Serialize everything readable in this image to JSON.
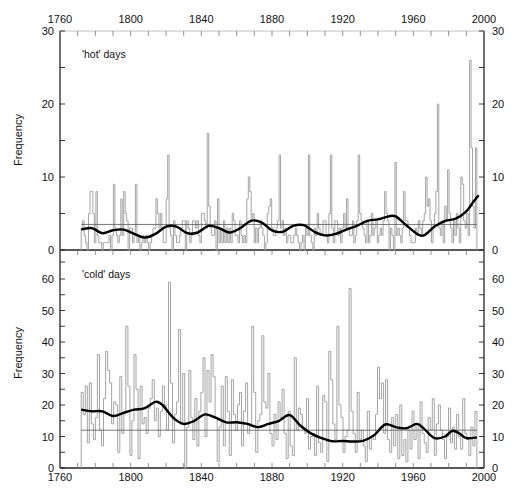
{
  "chart_data": [
    {
      "type": "line",
      "panel": "top",
      "title": "'hot' days",
      "xlabel": "",
      "ylabel": "Frequency",
      "xlim": [
        1760,
        2000
      ],
      "ylim": [
        0,
        30
      ],
      "x_ticks": [
        1760,
        1800,
        1840,
        1880,
        1920,
        1960,
        2000
      ],
      "y_ticks": [
        0,
        10,
        20,
        30
      ],
      "grid": false,
      "mean_line": 3.5,
      "series": [
        {
          "name": "annual frequency",
          "style": "step",
          "color": "#9a9a9a",
          "x_start": 1772,
          "values": [
            3,
            4,
            2,
            1,
            0,
            5,
            8,
            8,
            5,
            1,
            8,
            2,
            1,
            1,
            0,
            1,
            1,
            1,
            1,
            2,
            0,
            2,
            9,
            3,
            2,
            1,
            2,
            7,
            2,
            8,
            5,
            4,
            0,
            3,
            3,
            1,
            2,
            9,
            1,
            2,
            0,
            1,
            2,
            1,
            2,
            1,
            0,
            1,
            2,
            3,
            3,
            7,
            5,
            3,
            5,
            3,
            1,
            1,
            7,
            13,
            3,
            2,
            0,
            4,
            2,
            1,
            1,
            2,
            3,
            4,
            4,
            0,
            4,
            3,
            1,
            2,
            4,
            4,
            3,
            4,
            2,
            1,
            5,
            5,
            4,
            3,
            16,
            6,
            3,
            2,
            2,
            4,
            0,
            7,
            1,
            3,
            1,
            4,
            1,
            3,
            1,
            3,
            1,
            5,
            4,
            2,
            2,
            1,
            4,
            2,
            1,
            2,
            1,
            7,
            10,
            8,
            4,
            5,
            1,
            3,
            1,
            3,
            4,
            3,
            2,
            0,
            1,
            5,
            6,
            7,
            3,
            2,
            2,
            3,
            4,
            13,
            3,
            4,
            2,
            3,
            1,
            2,
            2,
            1,
            1,
            2,
            3,
            2,
            1,
            0,
            1,
            2,
            0,
            3,
            2,
            13,
            2,
            1,
            0,
            3,
            2,
            5,
            3,
            2,
            2,
            4,
            4,
            2,
            1,
            5,
            13,
            3,
            1,
            4,
            4,
            2,
            3,
            1,
            3,
            5,
            3,
            7,
            3,
            2,
            2,
            4,
            1,
            2,
            4,
            13,
            5,
            4,
            3,
            2,
            1,
            4,
            1,
            2,
            5,
            2,
            3,
            4,
            1,
            2,
            3,
            2,
            4,
            8,
            5,
            4,
            0,
            3,
            2,
            0,
            12,
            2,
            3,
            2,
            1,
            3,
            8,
            4,
            4,
            3,
            2,
            1,
            1,
            1,
            3,
            2,
            4,
            3,
            2,
            4,
            5,
            10,
            6,
            7,
            4,
            1,
            3,
            5,
            8,
            20,
            3,
            2,
            4,
            1,
            6,
            4,
            11,
            5,
            3,
            1,
            4,
            2,
            5,
            3,
            1,
            10,
            9,
            4,
            3,
            5,
            2,
            26,
            14,
            6,
            3,
            14
          ]
        },
        {
          "name": "smoothed",
          "style": "smooth",
          "color": "#000000",
          "points": [
            [
              1772,
              2.8
            ],
            [
              1778,
              3.0
            ],
            [
              1784,
              2.3
            ],
            [
              1790,
              2.7
            ],
            [
              1796,
              2.8
            ],
            [
              1802,
              2.2
            ],
            [
              1808,
              1.7
            ],
            [
              1814,
              2.2
            ],
            [
              1820,
              3.2
            ],
            [
              1826,
              3.2
            ],
            [
              1832,
              2.3
            ],
            [
              1838,
              2.4
            ],
            [
              1844,
              3.3
            ],
            [
              1850,
              3.0
            ],
            [
              1856,
              2.4
            ],
            [
              1862,
              3.0
            ],
            [
              1868,
              4.0
            ],
            [
              1874,
              3.8
            ],
            [
              1880,
              2.7
            ],
            [
              1886,
              2.5
            ],
            [
              1892,
              3.3
            ],
            [
              1898,
              3.4
            ],
            [
              1904,
              2.5
            ],
            [
              1910,
              2.0
            ],
            [
              1916,
              2.2
            ],
            [
              1922,
              2.8
            ],
            [
              1928,
              3.3
            ],
            [
              1934,
              4.0
            ],
            [
              1940,
              4.2
            ],
            [
              1946,
              4.6
            ],
            [
              1950,
              4.6
            ],
            [
              1956,
              3.4
            ],
            [
              1962,
              2.2
            ],
            [
              1966,
              2.0
            ],
            [
              1972,
              3.2
            ],
            [
              1978,
              4.0
            ],
            [
              1984,
              4.3
            ],
            [
              1990,
              5.3
            ],
            [
              1994,
              6.6
            ],
            [
              1997,
              7.5
            ]
          ]
        }
      ]
    },
    {
      "type": "line",
      "panel": "bottom",
      "title": "'cold' days",
      "xlabel": "",
      "ylabel": "Frequency",
      "xlim": [
        1760,
        2000
      ],
      "ylim": [
        0,
        65
      ],
      "x_ticks": [
        1760,
        1800,
        1840,
        1880,
        1920,
        1960,
        2000
      ],
      "y_ticks": [
        0,
        10,
        20,
        30,
        40,
        50,
        60
      ],
      "grid": false,
      "mean_line": 12,
      "series": [
        {
          "name": "annual frequency",
          "style": "step",
          "color": "#9a9a9a",
          "x_start": 1772,
          "values": [
            24,
            17,
            26,
            8,
            27,
            14,
            9,
            16,
            36,
            12,
            7,
            22,
            37,
            31,
            27,
            14,
            21,
            20,
            5,
            29,
            11,
            18,
            45,
            26,
            4,
            15,
            36,
            25,
            3,
            26,
            14,
            16,
            11,
            19,
            22,
            28,
            15,
            19,
            10,
            18,
            26,
            20,
            12,
            59,
            27,
            8,
            17,
            21,
            44,
            14,
            30,
            0,
            13,
            31,
            16,
            9,
            22,
            7,
            18,
            24,
            35,
            10,
            31,
            21,
            36,
            29,
            16,
            2,
            13,
            26,
            7,
            29,
            18,
            4,
            28,
            17,
            12,
            20,
            24,
            7,
            18,
            27,
            11,
            14,
            45,
            24,
            5,
            15,
            17,
            42,
            21,
            19,
            30,
            11,
            7,
            17,
            9,
            21,
            16,
            25,
            11,
            3,
            18,
            7,
            4,
            35,
            12,
            19,
            17,
            13,
            11,
            22,
            6,
            10,
            11,
            4,
            26,
            8,
            5,
            23,
            21,
            2,
            37,
            28,
            14,
            9,
            45,
            20,
            16,
            5,
            10,
            12,
            57,
            18,
            11,
            5,
            24,
            9,
            12,
            7,
            2,
            18,
            6,
            10,
            9,
            17,
            32,
            22,
            27,
            11,
            28,
            9,
            5,
            16,
            7,
            17,
            3,
            20,
            4,
            9,
            2,
            12,
            6,
            18,
            9,
            14,
            3,
            21,
            11,
            8,
            5,
            16,
            12,
            22,
            4,
            14,
            20,
            12,
            9,
            3,
            10,
            19,
            8,
            13,
            6,
            17,
            10,
            6,
            22,
            11,
            9,
            4,
            13,
            7,
            18
          ]
        },
        {
          "name": "smoothed",
          "style": "smooth",
          "color": "#000000",
          "points": [
            [
              1772,
              18.5
            ],
            [
              1778,
              18.0
            ],
            [
              1784,
              18.0
            ],
            [
              1790,
              16.5
            ],
            [
              1796,
              17.5
            ],
            [
              1802,
              18.5
            ],
            [
              1808,
              19.0
            ],
            [
              1814,
              21.0
            ],
            [
              1818,
              20.0
            ],
            [
              1824,
              16.0
            ],
            [
              1830,
              14.0
            ],
            [
              1836,
              15.0
            ],
            [
              1842,
              17.0
            ],
            [
              1848,
              16.0
            ],
            [
              1854,
              14.5
            ],
            [
              1860,
              14.5
            ],
            [
              1866,
              14.0
            ],
            [
              1872,
              13.0
            ],
            [
              1878,
              14.0
            ],
            [
              1884,
              15.0
            ],
            [
              1890,
              16.8
            ],
            [
              1896,
              13.5
            ],
            [
              1902,
              11.0
            ],
            [
              1908,
              9.5
            ],
            [
              1914,
              8.5
            ],
            [
              1920,
              8.6
            ],
            [
              1926,
              8.4
            ],
            [
              1932,
              8.7
            ],
            [
              1938,
              10.5
            ],
            [
              1944,
              13.8
            ],
            [
              1950,
              13.0
            ],
            [
              1956,
              12.6
            ],
            [
              1962,
              14.0
            ],
            [
              1966,
              12.5
            ],
            [
              1972,
              9.5
            ],
            [
              1978,
              10.0
            ],
            [
              1982,
              11.8
            ],
            [
              1986,
              11.0
            ],
            [
              1990,
              9.5
            ],
            [
              1996,
              9.7
            ]
          ]
        }
      ]
    }
  ],
  "axes": {
    "top_x_tick_labels": [
      "1760",
      "1800",
      "1840",
      "1880",
      "1920",
      "1960",
      "2000"
    ],
    "bottom_x_tick_labels": [
      "1760",
      "1800",
      "1840",
      "1880",
      "1920",
      "1960",
      "2000"
    ],
    "top_y_left_labels": [
      "30",
      "20",
      "10",
      "0"
    ],
    "top_y_right_labels": [
      "30",
      "20",
      "10",
      "0"
    ],
    "bottom_y_left_labels": [
      "60",
      "50",
      "40",
      "30",
      "20",
      "10",
      "0"
    ],
    "bottom_y_right_labels": [
      "60",
      "50",
      "40",
      "30",
      "20",
      "10",
      "0"
    ],
    "ylabel_top": "Frequency",
    "ylabel_bottom": "Frequency"
  },
  "panels": {
    "top_label": "'hot' days",
    "bottom_label": "'cold' days"
  },
  "colors": {
    "annual": "#9a9a9a",
    "smooth": "#000000",
    "axis": "#222222",
    "mean": "#555555"
  }
}
